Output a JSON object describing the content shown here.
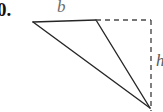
{
  "figure": {
    "item_number": "0.",
    "labels": {
      "base": "b",
      "height": "h"
    },
    "colors": {
      "stroke": "#262626",
      "dashed_stroke": "#4a4a4a",
      "background": "#ffffff",
      "label_base": "#6b6b6b",
      "label_height": "#5a5a5a",
      "item_number": "#111111"
    },
    "geometry": {
      "apex_left": [
        33,
        22
      ],
      "apex_mid": [
        96,
        20
      ],
      "vertex_bottom_right": [
        150,
        108
      ],
      "dashed_corner": [
        151,
        20
      ],
      "solid_top_edge": [
        [
          33,
          22
        ],
        [
          96,
          20
        ]
      ],
      "solid_edge_mid_to_bottom": [
        [
          96,
          20
        ],
        [
          150,
          108
        ]
      ],
      "solid_edge_left_to_bottom": [
        [
          33,
          22
        ],
        [
          150,
          108
        ]
      ],
      "dashed_top_edge": [
        [
          96,
          20
        ],
        [
          151,
          20
        ]
      ],
      "dashed_right_edge": [
        [
          151,
          20
        ],
        [
          151,
          110
        ]
      ],
      "stroke_width": 1.4,
      "dash_pattern": "5 4"
    }
  }
}
